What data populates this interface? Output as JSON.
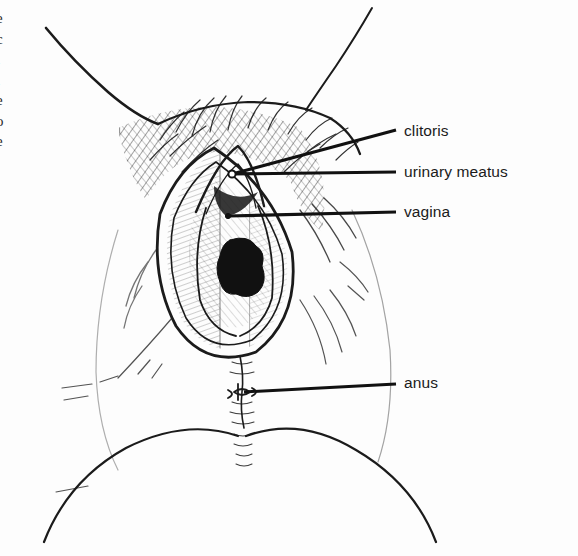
{
  "page": {
    "background_color": "#fdfdfd",
    "ink_color": "#1b1b1b",
    "width": 578,
    "height": 556
  },
  "margin_column": {
    "description": "cut-off letter fragments from adjacent page column at left edge",
    "letters": [
      "e",
      "c",
      "l",
      "l",
      "e",
      "o",
      "e"
    ]
  },
  "illustration": {
    "type": "anatomical-line-drawing",
    "subject": "female external genitalia, lithotomy view",
    "style": "pen-and-ink hatched medical illustration",
    "fill_color": "#111111"
  },
  "labels": [
    {
      "id": "clitoris",
      "text": "clitoris",
      "leader": {
        "x1": 232,
        "y1": 174,
        "x2": 396,
        "y2": 130
      },
      "has_dot": true
    },
    {
      "id": "urinary-meatus",
      "text": "urinary meatus",
      "leader": {
        "x1": 232,
        "y1": 174,
        "x2": 396,
        "y2": 172
      },
      "has_dot": true
    },
    {
      "id": "vagina",
      "text": "vagina",
      "leader": {
        "x1": 228,
        "y1": 216,
        "x2": 396,
        "y2": 212
      },
      "has_dot": true
    },
    {
      "id": "anus",
      "text": "anus",
      "leader": {
        "x1": 244,
        "y1": 392,
        "x2": 396,
        "y2": 384
      },
      "has_dot": false
    }
  ]
}
